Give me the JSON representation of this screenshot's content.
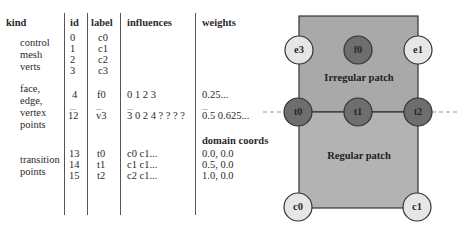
{
  "table": {
    "headers": [
      "kind",
      "id",
      "label",
      "influences",
      "weights"
    ],
    "groups": [
      {
        "kind": [
          "control",
          "mesh",
          "verts"
        ],
        "rows": [
          {
            "id": "0",
            "label": "c0",
            "influences": "",
            "weights": ""
          },
          {
            "id": "1",
            "label": "c1",
            "influences": "",
            "weights": ""
          },
          {
            "id": "2",
            "label": "c2",
            "influences": "",
            "weights": ""
          },
          {
            "id": "3",
            "label": "c3",
            "influences": "",
            "weights": ""
          }
        ]
      },
      {
        "kind": [
          "face,",
          "edge,",
          "vertex",
          "points"
        ],
        "rows": [
          {
            "id": "4",
            "label": "f0",
            "influences": "0 1 2 3",
            "weights": "0.25..."
          },
          {
            "id": "...",
            "label": "...",
            "influences": "...",
            "weights": "..."
          },
          {
            "id": "12",
            "label": "v3",
            "influences": "3 0 2 4 ? ? ? ?",
            "weights": "0.5 0.625..."
          }
        ]
      },
      {
        "kind": [
          "transition",
          "points"
        ],
        "subheader": "domain coords",
        "rows": [
          {
            "id": "13",
            "label": "t0",
            "influences": "c0 c1...",
            "weights": "0.0, 0.0"
          },
          {
            "id": "14",
            "label": "t1",
            "influences": "c1 c1...",
            "weights": "0.5, 0.0"
          },
          {
            "id": "15",
            "label": "t2",
            "influences": "c2 c1...",
            "weights": "1.0, 0.0"
          }
        ]
      }
    ]
  },
  "diagram": {
    "irregular_label": "Irregular patch",
    "regular_label": "Regular patch",
    "nodes": {
      "e3": "e3",
      "f0": "f0",
      "e1": "e1",
      "t0": "t0",
      "t1": "t1",
      "t2": "t2",
      "c0": "c0",
      "c1": "c1"
    },
    "colors": {
      "patch_fill": "#a9a9a9",
      "dark_node": "#6e6e6e",
      "light_node": "#e6e6e6",
      "stroke": "#333333",
      "dash": "#999999"
    }
  }
}
